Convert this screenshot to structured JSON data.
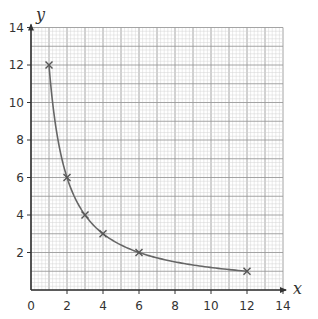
{
  "chart_data": {
    "type": "line",
    "title": "",
    "xlabel": "x",
    "ylabel": "y",
    "xlim": [
      0,
      14
    ],
    "ylim": [
      0,
      14
    ],
    "x_ticks": [
      0,
      2,
      4,
      6,
      8,
      10,
      12,
      14
    ],
    "y_ticks": [
      2,
      4,
      6,
      8,
      10,
      12,
      14
    ],
    "grid": {
      "on": true,
      "major_step": 1,
      "minor_step": 0.2
    },
    "legend": null,
    "series": [
      {
        "name": "y = 12/x",
        "marker": "x",
        "smooth": true,
        "x": [
          1,
          2,
          3,
          4,
          6,
          12
        ],
        "y": [
          12,
          6,
          4,
          3,
          2,
          1
        ]
      }
    ]
  },
  "colors": {
    "axis": "#333333",
    "curve": "#666666",
    "grid_major": "#9a9a9a",
    "grid_minor": "#d4d4d4",
    "marker": "#555555"
  }
}
